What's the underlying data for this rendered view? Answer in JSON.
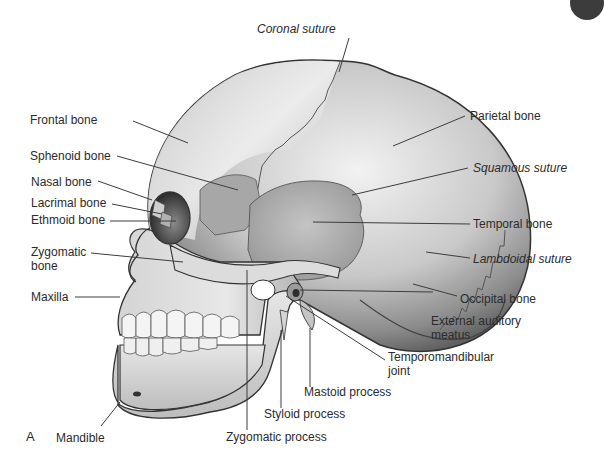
{
  "figure": {
    "panel_letter": "A",
    "colors": {
      "bone_light": "#e9e9e9",
      "bone_mid": "#b9b9b9",
      "bone_dark": "#6f6f6f",
      "outline": "#3a3a3a",
      "leader": "#3d3d3d",
      "text": "#2b2b2b"
    }
  },
  "labels": {
    "coronal_suture": "Coronal suture",
    "frontal_bone": "Frontal bone",
    "parietal_bone": "Parietal bone",
    "sphenoid_bone": "Sphenoid bone",
    "squamous_suture": "Squamous suture",
    "nasal_bone": "Nasal bone",
    "lacrimal_bone": "Lacrimal bone",
    "ethmoid_bone": "Ethmoid bone",
    "temporal_bone": "Temporal bone",
    "zygomatic_bone_1": "Zygomatic",
    "zygomatic_bone_2": "bone",
    "lambdoidal_suture": "Lambdoidal suture",
    "maxilla": "Maxilla",
    "occipital_bone": "Occipital bone",
    "external_auditory_meatus_1": "External auditory",
    "external_auditory_meatus_2": "meatus",
    "temporomandibular_joint_1": "Temporomandibular",
    "temporomandibular_joint_2": "joint",
    "mastoid_process": "Mastoid process",
    "styloid_process": "Styloid process",
    "mandible": "Mandible",
    "zygomatic_process": "Zygomatic process"
  }
}
